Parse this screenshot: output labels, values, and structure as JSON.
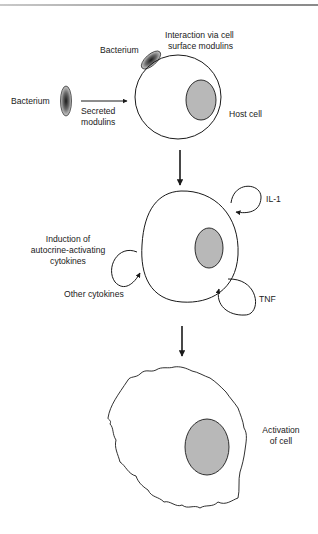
{
  "diagram": {
    "stages": [
      {
        "id": "host-cell",
        "labels": {
          "bacterium_left": "Bacterium",
          "secreted_modulins": [
            "Secreted",
            "modulins"
          ],
          "bacterium_top": "Bacterium",
          "surface_interaction": [
            "Interaction via cell",
            "surface modulins"
          ],
          "host_cell": "Host cell"
        }
      },
      {
        "id": "cytokine-induction",
        "labels": {
          "induction": [
            "Induction of",
            "autocrine-activating",
            "cytokines"
          ],
          "other_cytokines": "Other cytokines",
          "il1": "IL-1",
          "tnf": "TNF"
        }
      },
      {
        "id": "activated-cell",
        "labels": {
          "activation": [
            "Activation",
            "of cell"
          ]
        }
      }
    ],
    "colors": {
      "line": "#1a1a1a",
      "nucleus_fill": "#b8b8b8",
      "background": "#ffffff"
    }
  }
}
